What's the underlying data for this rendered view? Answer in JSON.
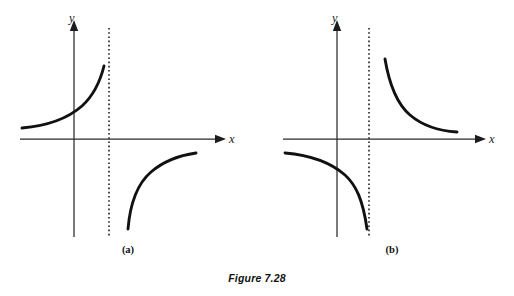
{
  "figure": {
    "caption": "Figure 7.28",
    "background_color": "#ffffff",
    "ink_color": "#111111",
    "width": 514,
    "height": 296
  },
  "panels": [
    {
      "id": "a",
      "label": "(a)",
      "label_x": 128,
      "label_y": 253,
      "axes": {
        "x_label": "x",
        "y_label": "y",
        "x_label_x": 229,
        "x_label_y": 143,
        "y_label_x": 69,
        "y_label_y": 22,
        "origin_x": 74,
        "origin_y": 139,
        "x_axis_start": 20,
        "x_axis_end": 216,
        "y_axis_top": 30,
        "y_axis_bottom": 237
      },
      "asymptote": {
        "x": 109,
        "y_top": 28,
        "y_bottom": 236,
        "style": "dotted"
      },
      "branches": [
        {
          "name": "upper-left-branch",
          "path": "M 22 128 C 45 126, 66 120, 82 106 C 93 96, 100 82, 104 66",
          "description": "rises from left toward asymptote from the left side"
        },
        {
          "name": "lower-right-branch",
          "path": "M 128 229 C 130 205, 137 184, 151 172 C 165 160, 182 155, 196 153",
          "description": "rises from below asymptote toward the x-axis on the right"
        }
      ]
    },
    {
      "id": "b",
      "label": "(b)",
      "label_x": 392,
      "label_y": 253,
      "axes": {
        "x_label": "x",
        "y_label": "y",
        "x_label_x": 489,
        "x_label_y": 143,
        "y_label_x": 332,
        "y_label_y": 22,
        "origin_x": 337,
        "origin_y": 139,
        "x_axis_start": 283,
        "x_axis_end": 476,
        "y_axis_top": 30,
        "y_axis_bottom": 237
      },
      "asymptote": {
        "x": 369,
        "y_top": 28,
        "y_bottom": 236,
        "style": "dotted"
      },
      "branches": [
        {
          "name": "upper-right-branch",
          "path": "M 385 59 C 389 83, 396 103, 410 115 C 424 127, 442 131, 457 132",
          "description": "falls from near asymptote to the right toward the x-axis"
        },
        {
          "name": "lower-left-branch",
          "path": "M 285 153 C 308 155, 329 161, 345 175 C 356 185, 363 200, 367 229",
          "description": "falls from the left down toward the asymptote"
        }
      ]
    }
  ],
  "caption_position": {
    "x": 257,
    "y": 282
  }
}
